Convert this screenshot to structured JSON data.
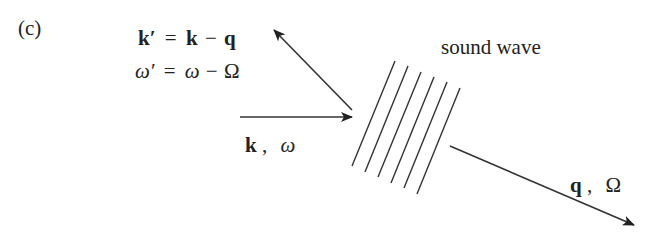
{
  "panel_label": "(c)",
  "equations": {
    "k_prime": {
      "lhs": "k′",
      "eq": "=",
      "k": "k",
      "minus": "−",
      "q": "q"
    },
    "omega_prime": {
      "lhs": "ω′",
      "eq": "=",
      "omega": "ω",
      "minus": "−",
      "Omega": "Ω"
    }
  },
  "labels": {
    "incident": {
      "k": "k",
      "sep": ",",
      "omega": "ω"
    },
    "sound_wave": "sound wave",
    "phonon": {
      "q": "q",
      "sep": ",",
      "Omega": "Ω"
    }
  },
  "colors": {
    "line": "#333333",
    "text": "#222222"
  },
  "geometry": {
    "incident_arrow": {
      "x1": 240,
      "y1": 117,
      "x2": 352,
      "y2": 117
    },
    "scattered_arrow": {
      "x1": 352,
      "y1": 110,
      "x2": 274,
      "y2": 30
    },
    "phonon_arrow": {
      "x1": 450,
      "y1": 146,
      "x2": 634,
      "y2": 225
    },
    "wavefronts": [
      {
        "x1": 352,
        "y1": 166,
        "x2": 395,
        "y2": 61
      },
      {
        "x1": 365,
        "y1": 172,
        "x2": 408,
        "y2": 66
      },
      {
        "x1": 378,
        "y1": 177,
        "x2": 421,
        "y2": 72
      },
      {
        "x1": 391,
        "y1": 183,
        "x2": 434,
        "y2": 77
      },
      {
        "x1": 404,
        "y1": 188,
        "x2": 447,
        "y2": 82
      },
      {
        "x1": 417,
        "y1": 194,
        "x2": 460,
        "y2": 88
      }
    ]
  }
}
